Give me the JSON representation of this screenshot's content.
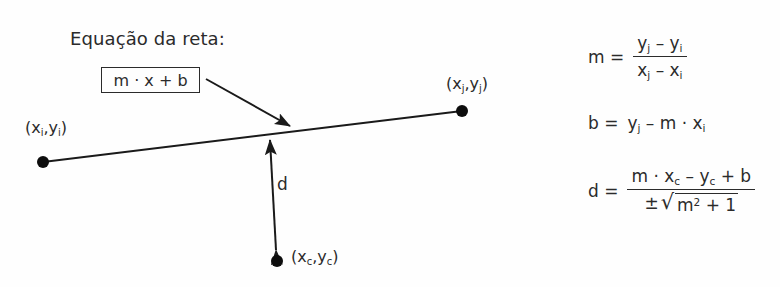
{
  "diagram": {
    "title": "Equação da reta:",
    "equation_box": {
      "text_plain": "m · x + b",
      "m": "m",
      "dot": "·",
      "x": "x",
      "plus": "+",
      "b": "b"
    },
    "points": [
      {
        "name": "point-i",
        "label_plain": "(xi,yi)",
        "open_paren": "(",
        "x_var": "x",
        "x_sub": "i",
        "comma": ",",
        "y_var": "y",
        "y_sub": "i",
        "close_paren": ")"
      },
      {
        "name": "point-j",
        "label_plain": "(xj,yj)",
        "open_paren": "(",
        "x_var": "x",
        "x_sub": "j",
        "comma": ",",
        "y_var": "y",
        "y_sub": "j",
        "close_paren": ")"
      },
      {
        "name": "point-c",
        "label_plain": "(xc,yc)",
        "open_paren": "(",
        "x_var": "x",
        "x_sub": "c",
        "comma": ",",
        "y_var": "y",
        "y_sub": "c",
        "close_paren": ")"
      }
    ],
    "distance_label": "d",
    "line_color": "#1a1a1a",
    "text_color": "#2b2b2b",
    "background_color": "#fefefe"
  },
  "formulas": {
    "slope": {
      "lhs": "m  =",
      "numerator_plain": "yj – yi",
      "denominator_plain": "xj – xi",
      "num": {
        "y1": "y",
        "sub1": "j",
        "minus": "–",
        "y2": "y",
        "sub2": "i"
      },
      "den": {
        "x1": "x",
        "sub1": "j",
        "minus": "–",
        "x2": "x",
        "sub2": "i"
      }
    },
    "intercept": {
      "plain": "b = yj – m · xi",
      "lhs": "b  =",
      "y": "y",
      "y_sub": "j",
      "minus": "–",
      "m": "m",
      "dot": "·",
      "x": "x",
      "x_sub": "i"
    },
    "distance": {
      "lhs": "d  =",
      "numerator_plain": "m · xc – yc + b",
      "denominator_plain": "± √(m² + 1)",
      "num": {
        "m": "m",
        "dot": "·",
        "x": "x",
        "x_sub": "c",
        "minus": "–",
        "y": "y",
        "y_sub": "c",
        "plus": "+",
        "b": "b"
      },
      "den": {
        "pm": "±",
        "root": "√",
        "m": "m",
        "exp": "2",
        "plus": "+",
        "one": "1"
      }
    }
  }
}
